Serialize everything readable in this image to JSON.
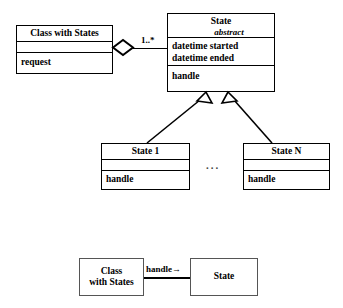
{
  "diagram": {
    "colors": {
      "stroke": "#000000",
      "fill": "#ffffff",
      "plain_stroke": "#555555",
      "dots": "#444444"
    },
    "top": {
      "class_with_states": {
        "name": "Class with States",
        "attributes": [],
        "operations": [
          "request"
        ]
      },
      "state": {
        "name": "State",
        "stereotype": "abstract",
        "attributes": [
          "datetime started",
          "datetime ended"
        ],
        "operations": [
          "handle"
        ]
      },
      "aggregation": {
        "kind": "aggregation-diamond",
        "multiplicity": "1..*"
      },
      "subclasses": [
        {
          "name": "State 1",
          "attributes": [],
          "operations": [
            "handle"
          ]
        },
        {
          "name": "State N",
          "attributes": [],
          "operations": [
            "handle"
          ]
        }
      ],
      "between_subclasses": "...",
      "generalization": "hollow-triangle"
    },
    "bottom": {
      "source": {
        "line1": "Class",
        "line2": "with States"
      },
      "target": {
        "line1": "State"
      },
      "link_label": "handle",
      "link_arrow": "→"
    }
  }
}
